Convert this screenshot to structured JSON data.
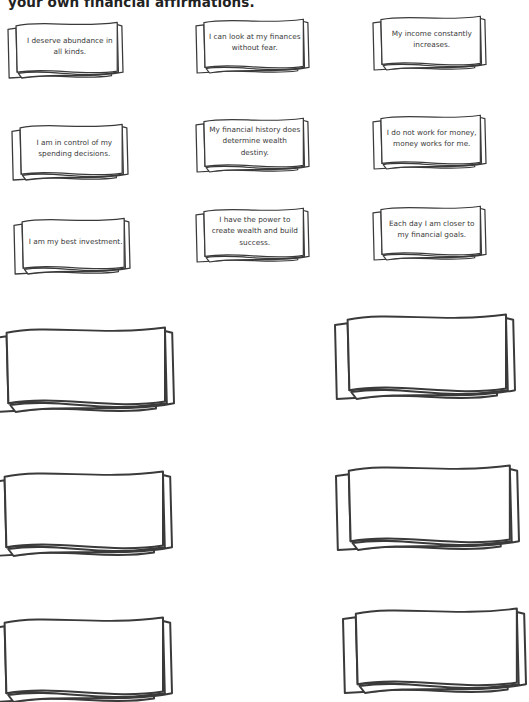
{
  "intro": {
    "text": "your own financial affirmations."
  },
  "affirmation_cards": [
    {
      "text": "I deserve abundance in all kinds.",
      "x": 8,
      "y": 20,
      "w": 115,
      "h": 58,
      "text_align": "left"
    },
    {
      "text": "I can look at my finances without fear.",
      "x": 196,
      "y": 17,
      "w": 113,
      "h": 56
    },
    {
      "text": "My income constantly increases.",
      "x": 373,
      "y": 14,
      "w": 113,
      "h": 56
    },
    {
      "text": "I am in control of my spending decisions.",
      "x": 12,
      "y": 122,
      "w": 116,
      "h": 58,
      "text_align": "left"
    },
    {
      "text": "My financial history does determine wealth destiny.",
      "x": 196,
      "y": 116,
      "w": 113,
      "h": 56
    },
    {
      "text": "I do not work for money, money works for me.",
      "x": 373,
      "y": 113,
      "w": 113,
      "h": 56
    },
    {
      "text": "I am my best investment.",
      "x": 14,
      "y": 216,
      "w": 116,
      "h": 58,
      "text_align": "left"
    },
    {
      "text": "I have the power to create wealth and build success.",
      "x": 196,
      "y": 206,
      "w": 113,
      "h": 56
    },
    {
      "text": "Each day I am closer to my financial goals.",
      "x": 373,
      "y": 204,
      "w": 113,
      "h": 56
    }
  ],
  "blank_cards": [
    {
      "x": -6,
      "y": 324,
      "w": 180,
      "h": 88
    },
    {
      "x": 335,
      "y": 311,
      "w": 180,
      "h": 88
    },
    {
      "x": -8,
      "y": 468,
      "w": 180,
      "h": 88
    },
    {
      "x": 336,
      "y": 462,
      "w": 183,
      "h": 88
    },
    {
      "x": -8,
      "y": 614,
      "w": 180,
      "h": 88
    },
    {
      "x": 343,
      "y": 605,
      "w": 183,
      "h": 88
    }
  ]
}
